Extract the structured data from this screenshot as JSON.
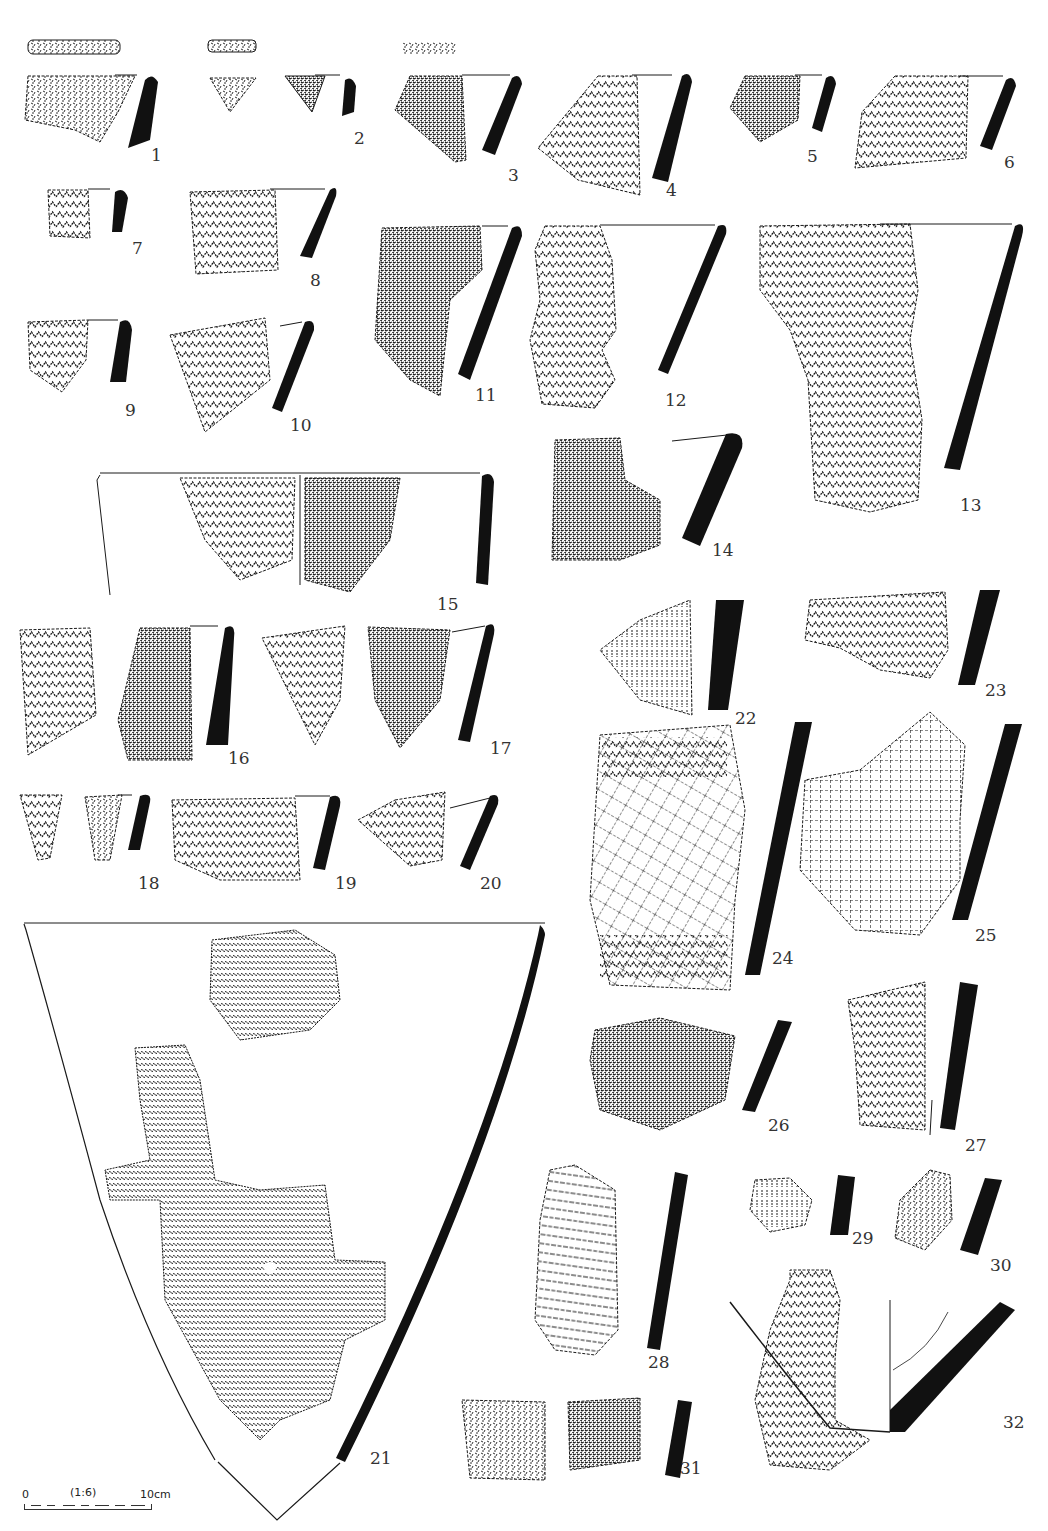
{
  "figure": {
    "type": "archaeological pottery sherd plate",
    "scale_bar": {
      "start_label": "0",
      "ratio_label": "(1:6)",
      "end_label": "10cm"
    },
    "sherd_numbers": [
      "1",
      "2",
      "3",
      "4",
      "5",
      "6",
      "7",
      "8",
      "9",
      "10",
      "11",
      "12",
      "13",
      "14",
      "15",
      "16",
      "17",
      "18",
      "19",
      "20",
      "21",
      "22",
      "23",
      "24",
      "25",
      "26",
      "27",
      "28",
      "29",
      "30",
      "31",
      "32"
    ],
    "colors": {
      "ink": "#1a1a1a",
      "paper": "#ffffff"
    }
  }
}
